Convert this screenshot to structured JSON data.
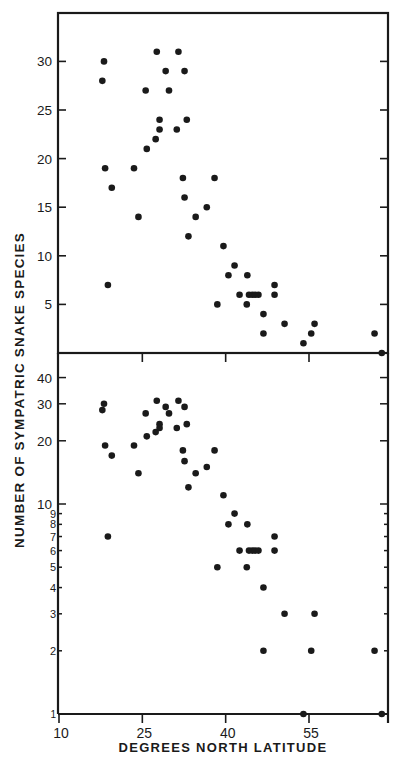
{
  "chart_data": [
    {
      "type": "scatter",
      "panel": "top",
      "yscale": "linear",
      "xlabel": "DEGREES NORTH LATITUDE",
      "ylabel": "NUMBER OF SYMPATRIC SNAKE SPECIES",
      "xlim": [
        10,
        69
      ],
      "ylim": [
        0,
        35
      ],
      "yticks": [
        5,
        10,
        15,
        20,
        25,
        30
      ],
      "ytick_labels": [
        "5",
        "10",
        "15",
        "20",
        "25",
        "30"
      ],
      "xticks": [
        25,
        40,
        55
      ],
      "points": [
        [
          18.1,
          30
        ],
        [
          17.8,
          28
        ],
        [
          18.3,
          19
        ],
        [
          19.5,
          17
        ],
        [
          18.8,
          7
        ],
        [
          23.5,
          19
        ],
        [
          24.3,
          14
        ],
        [
          25.6,
          27
        ],
        [
          25.8,
          21
        ],
        [
          27.4,
          22
        ],
        [
          27.6,
          31
        ],
        [
          28.1,
          24
        ],
        [
          28.1,
          23
        ],
        [
          29.2,
          29
        ],
        [
          29.8,
          27
        ],
        [
          31.2,
          23
        ],
        [
          31.5,
          31
        ],
        [
          32.3,
          18
        ],
        [
          32.6,
          29
        ],
        [
          32.6,
          16
        ],
        [
          33.0,
          24
        ],
        [
          33.3,
          12
        ],
        [
          34.6,
          14
        ],
        [
          36.6,
          15
        ],
        [
          38.0,
          18
        ],
        [
          38.5,
          5
        ],
        [
          39.6,
          11
        ],
        [
          40.5,
          8
        ],
        [
          41.6,
          9
        ],
        [
          42.5,
          6
        ],
        [
          43.8,
          5
        ],
        [
          43.9,
          8
        ],
        [
          44.2,
          6
        ],
        [
          44.8,
          6
        ],
        [
          45.3,
          6
        ],
        [
          45.9,
          6
        ],
        [
          46.8,
          4
        ],
        [
          46.8,
          2
        ],
        [
          48.8,
          7
        ],
        [
          48.8,
          6
        ],
        [
          50.6,
          3
        ],
        [
          54.0,
          1
        ],
        [
          55.4,
          2
        ],
        [
          56.0,
          3
        ],
        [
          66.8,
          2
        ],
        [
          68.1,
          0
        ]
      ]
    },
    {
      "type": "scatter",
      "panel": "bottom",
      "yscale": "log",
      "xlabel": "DEGREES NORTH LATITUDE",
      "ylabel": "NUMBER OF SYMPATRIC SNAKE SPECIES",
      "xlim": [
        10,
        69
      ],
      "ylim": [
        1,
        50
      ],
      "yticks": [
        1,
        2,
        3,
        4,
        5,
        6,
        7,
        8,
        9,
        10,
        20,
        30,
        40
      ],
      "ytick_labels": [
        "1",
        "2",
        "3",
        "4",
        "5",
        "6",
        "7",
        "8",
        "9",
        "10",
        "20",
        "30",
        "40"
      ],
      "xticks": [
        10,
        25,
        40,
        55
      ],
      "xtick_labels": [
        "10",
        "25",
        "40",
        "55"
      ],
      "points": [
        [
          18.1,
          30
        ],
        [
          17.8,
          28
        ],
        [
          18.3,
          19
        ],
        [
          19.5,
          17
        ],
        [
          18.8,
          7
        ],
        [
          23.5,
          19
        ],
        [
          24.3,
          14
        ],
        [
          25.6,
          27
        ],
        [
          25.8,
          21
        ],
        [
          27.4,
          22
        ],
        [
          27.6,
          31
        ],
        [
          28.1,
          24
        ],
        [
          28.1,
          23
        ],
        [
          29.2,
          29
        ],
        [
          29.8,
          27
        ],
        [
          31.2,
          23
        ],
        [
          31.5,
          31
        ],
        [
          32.3,
          18
        ],
        [
          32.6,
          29
        ],
        [
          32.6,
          16
        ],
        [
          33.0,
          24
        ],
        [
          33.3,
          12
        ],
        [
          34.6,
          14
        ],
        [
          36.6,
          15
        ],
        [
          38.0,
          18
        ],
        [
          38.5,
          5
        ],
        [
          39.6,
          11
        ],
        [
          40.5,
          8
        ],
        [
          41.6,
          9
        ],
        [
          42.5,
          6
        ],
        [
          43.8,
          5
        ],
        [
          43.9,
          8
        ],
        [
          44.2,
          6
        ],
        [
          44.8,
          6
        ],
        [
          45.3,
          6
        ],
        [
          45.9,
          6
        ],
        [
          46.8,
          4
        ],
        [
          46.8,
          2
        ],
        [
          48.8,
          7
        ],
        [
          48.8,
          6
        ],
        [
          50.6,
          3
        ],
        [
          54.0,
          1
        ],
        [
          55.4,
          2
        ],
        [
          56.0,
          3
        ],
        [
          66.8,
          2
        ],
        [
          68.1,
          0
        ]
      ]
    }
  ],
  "labels": {
    "ylabel": "NUMBER OF SYMPATRIC SNAKE SPECIES",
    "xlabel": "DEGREES NORTH LATITUDE",
    "xtick_labels": [
      "10",
      "25",
      "40",
      "55"
    ]
  },
  "colors": {
    "ink": "#1a1a1a",
    "background": "#ffffff"
  }
}
